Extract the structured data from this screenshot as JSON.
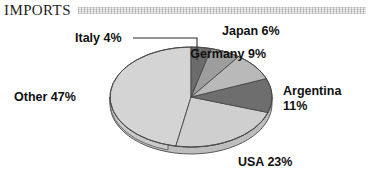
{
  "header": {
    "title": "IMPORTS",
    "band_icon": "decorative-texture-band"
  },
  "colors": {
    "background": "#ffffff",
    "text": "#111111",
    "title_text": "#1c1c1c",
    "band": "#f0f0f0",
    "outline": "#4a4a4a",
    "leader_line": "#2b2b2b",
    "slice_other": "#d4d4d4",
    "slice_usa": "#cfcfcf",
    "slice_argentina": "#6e6e6e",
    "slice_germany": "#b9b9b9",
    "slice_japan": "#9d9d9d",
    "slice_italy": "#6b6b6b"
  },
  "labels": {
    "italy": "Italy 4%",
    "japan": "Japan 6%",
    "germany": "Germany 9%",
    "argentina_name": "Argentina",
    "argentina_value": "11%",
    "usa": "USA 23%",
    "other": "Other 47%"
  },
  "chart_data": {
    "type": "pie",
    "title": "IMPORTS",
    "subtitle": "",
    "xlabel": "",
    "ylabel": "",
    "grid": false,
    "legend_position": "none",
    "three_d": true,
    "start_angle_deg": 0,
    "direction": "clockwise",
    "units": "percent",
    "total": 100,
    "categories": [
      "Italy",
      "Japan",
      "Germany",
      "Argentina",
      "USA",
      "Other"
    ],
    "values": [
      4,
      6,
      9,
      11,
      23,
      47
    ],
    "slices": [
      {
        "label": "Italy",
        "value": 4,
        "display": "Italy 4%",
        "color": "#6b6b6b",
        "label_position": "top-left-with-leader"
      },
      {
        "label": "Japan",
        "value": 6,
        "display": "Japan 6%",
        "color": "#9d9d9d",
        "label_position": "top-right"
      },
      {
        "label": "Germany",
        "value": 9,
        "display": "Germany 9%",
        "color": "#b9b9b9",
        "label_position": "right-upper"
      },
      {
        "label": "Argentina",
        "value": 11,
        "display": "Argentina 11%",
        "color": "#6e6e6e",
        "label_position": "right"
      },
      {
        "label": "USA",
        "value": 23,
        "display": "USA 23%",
        "color": "#cfcfcf",
        "label_position": "bottom-right"
      },
      {
        "label": "Other",
        "value": 47,
        "display": "Other 47%",
        "color": "#d4d4d4",
        "label_position": "left"
      }
    ],
    "annotations": [
      {
        "type": "leader-line",
        "from": "Italy label",
        "to": "Italy slice"
      }
    ]
  }
}
